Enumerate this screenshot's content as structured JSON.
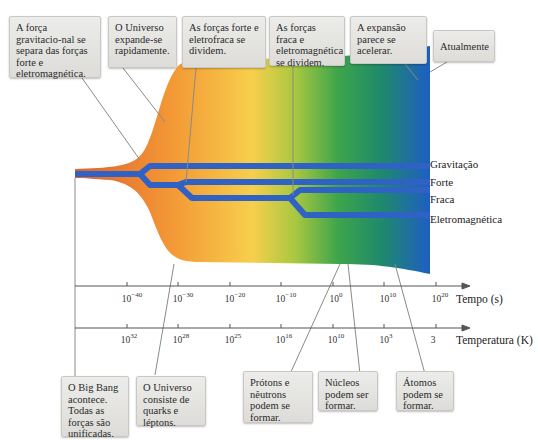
{
  "top_callouts": [
    {
      "text": "A força gravitacio-nal se separa das forças forte e eletromagnética."
    },
    {
      "text": "O Universo expande-se rapidamente."
    },
    {
      "text": "As forças forte e eletrofraca se dividem."
    },
    {
      "text": "As forças fraca e eletromagnética se dividem."
    },
    {
      "text": "A expansão parece se acelerar."
    },
    {
      "text": "Atualmente"
    }
  ],
  "bottom_callouts": [
    {
      "text": "O Big Bang acontece. Todas as forças são unificadas."
    },
    {
      "text": "O Universo consiste de quarks e léptons."
    },
    {
      "text": "Prótons e nêutrons podem se formar."
    },
    {
      "text": "Núcleos podem ser formar."
    },
    {
      "text": "Átomos podem se formar."
    }
  ],
  "force_labels": [
    "Gravitação",
    "Forte",
    "Fraca",
    "Eletromagnética"
  ],
  "time_axis": {
    "title": "Tempo (s)",
    "ticks": [
      {
        "base": "10",
        "exp": "−40"
      },
      {
        "base": "10",
        "exp": "−30"
      },
      {
        "base": "10",
        "exp": "−20"
      },
      {
        "base": "10",
        "exp": "−10"
      },
      {
        "base": "10",
        "exp": "0"
      },
      {
        "base": "10",
        "exp": "10"
      },
      {
        "base": "10",
        "exp": "20"
      }
    ]
  },
  "temperature_axis": {
    "title": "Temperatura (K)",
    "ticks": [
      {
        "base": "10",
        "exp": "32"
      },
      {
        "base": "10",
        "exp": "28"
      },
      {
        "base": "10",
        "exp": "25"
      },
      {
        "base": "10",
        "exp": "16"
      },
      {
        "base": "10",
        "exp": "10"
      },
      {
        "base": "10",
        "exp": "3"
      },
      {
        "base": "3",
        "exp": ""
      }
    ]
  },
  "colors": {
    "force_line": "#2f62c4",
    "band_start": "#e8722e",
    "band_mid": "#f6d24a",
    "band_green": "#4caf45",
    "band_end": "#1f5fc0",
    "callout_bg": "#e4e3e0"
  }
}
